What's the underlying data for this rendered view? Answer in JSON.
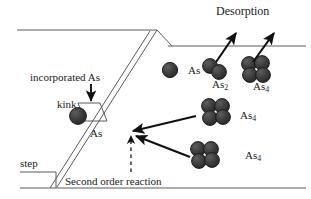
{
  "figure": {
    "background_color": "#ffffff",
    "line_color": "#555555",
    "arrow_color": "#111111",
    "sphere_color": "#3c3c3c",
    "sphere_edge_color": "#1a1a1a",
    "text_color": "#1a1a1a"
  },
  "labels": {
    "desorption": "Desorption",
    "incorporated_as": "incorporated As",
    "kink": "kink",
    "as_at_kink": "As",
    "step": "step",
    "second_order_reaction": "Second order reaction",
    "as_single": "As",
    "as2": "As",
    "as2_sub": "2",
    "as4_top": "As",
    "as4_top_sub": "4",
    "as4_mid": "As",
    "as4_mid_sub": "4",
    "as4_low": "As",
    "as4_low_sub": "4"
  },
  "species": [
    {
      "name": "as-adatom-terrace",
      "formula": "As",
      "atoms": 1,
      "x": 170,
      "y": 70
    },
    {
      "name": "as2-dimer",
      "formula": "As2",
      "atoms": 2,
      "x": 215,
      "y": 69
    },
    {
      "name": "as4-tetramer-top",
      "formula": "As4",
      "atoms": 4,
      "x": 255,
      "y": 69
    },
    {
      "name": "as4-tetramer-middle",
      "formula": "As4",
      "atoms": 4,
      "x": 215,
      "y": 112
    },
    {
      "name": "as4-tetramer-lower",
      "formula": "As4",
      "atoms": 4,
      "x": 204,
      "y": 155
    },
    {
      "name": "as-atom-at-kink",
      "formula": "As",
      "atoms": 1,
      "x": 78,
      "y": 116
    }
  ],
  "surface": {
    "upper_terrace_label": "upper terrace",
    "lower_terrace_label": "lower terrace",
    "step_edge_label": "step edge",
    "kink_site_label": "kink site"
  },
  "arrows": [
    {
      "name": "desorption-arrow-as2",
      "from": [
        216,
        62
      ],
      "to": [
        236,
        33
      ]
    },
    {
      "name": "desorption-arrow-as4",
      "from": [
        253,
        62
      ],
      "to": [
        274,
        33
      ]
    },
    {
      "name": "incorporation-arrow",
      "from": [
        91,
        84
      ],
      "to": [
        91,
        101
      ]
    },
    {
      "name": "as4-middle-to-kink-arrow",
      "from": [
        196,
        116
      ],
      "to": [
        133,
        131
      ]
    },
    {
      "name": "as4-lower-to-kink-arrow",
      "from": [
        190,
        157
      ],
      "to": [
        136,
        136
      ]
    },
    {
      "name": "second-order-reaction-dashed-arrow",
      "from": [
        131,
        172
      ],
      "to": [
        131,
        138
      ]
    }
  ]
}
